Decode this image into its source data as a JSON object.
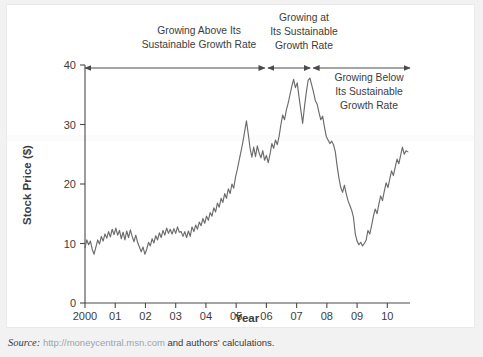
{
  "figure": {
    "background_color": "#f2f2f2",
    "panel_color": "#ffffff",
    "line_color": "#6b6b6b",
    "axis_color": "#4a4a4a"
  },
  "source": {
    "label": "Source:",
    "url": "http://moneycentral.msn.com",
    "tail": "and authors' calculations."
  },
  "chart_data": {
    "type": "line",
    "title": "",
    "xlabel": "Year",
    "ylabel": "Stock Price ($)",
    "xlim": [
      2000.0,
      2010.75
    ],
    "ylim": [
      0,
      40
    ],
    "grid": false,
    "legend": "none",
    "xtick_labels": [
      "2000",
      "01",
      "02",
      "03",
      "04",
      "05",
      "06",
      "07",
      "08",
      "09",
      "10"
    ],
    "xtick_values": [
      2000,
      2001,
      2002,
      2003,
      2004,
      2005,
      2006,
      2007,
      2008,
      2009,
      2010
    ],
    "ytick_labels": [
      "0",
      "10",
      "20",
      "30",
      "40"
    ],
    "ytick_values": [
      0,
      10,
      20,
      30,
      40
    ],
    "series": [
      {
        "name": "Stock Price",
        "x": [
          2000.0,
          2000.06,
          2000.12,
          2000.18,
          2000.24,
          2000.3,
          2000.36,
          2000.42,
          2000.48,
          2000.54,
          2000.6,
          2000.66,
          2000.72,
          2000.78,
          2000.84,
          2000.9,
          2000.96,
          2001.02,
          2001.08,
          2001.14,
          2001.2,
          2001.26,
          2001.32,
          2001.38,
          2001.44,
          2001.5,
          2001.56,
          2001.62,
          2001.68,
          2001.74,
          2001.8,
          2001.86,
          2001.92,
          2001.98,
          2002.04,
          2002.1,
          2002.16,
          2002.22,
          2002.28,
          2002.34,
          2002.4,
          2002.46,
          2002.52,
          2002.58,
          2002.64,
          2002.7,
          2002.76,
          2002.82,
          2002.88,
          2002.94,
          2003.0,
          2003.06,
          2003.12,
          2003.18,
          2003.24,
          2003.3,
          2003.36,
          2003.42,
          2003.48,
          2003.54,
          2003.6,
          2003.66,
          2003.72,
          2003.78,
          2003.84,
          2003.9,
          2003.96,
          2004.02,
          2004.08,
          2004.14,
          2004.2,
          2004.26,
          2004.32,
          2004.38,
          2004.44,
          2004.5,
          2004.56,
          2004.62,
          2004.68,
          2004.74,
          2004.8,
          2004.86,
          2004.92,
          2004.98,
          2005.04,
          2005.1,
          2005.16,
          2005.22,
          2005.28,
          2005.34,
          2005.4,
          2005.46,
          2005.52,
          2005.58,
          2005.64,
          2005.7,
          2005.76,
          2005.82,
          2005.88,
          2005.94,
          2006.0,
          2006.06,
          2006.12,
          2006.18,
          2006.24,
          2006.3,
          2006.36,
          2006.42,
          2006.48,
          2006.54,
          2006.6,
          2006.66,
          2006.72,
          2006.78,
          2006.84,
          2006.9,
          2006.96,
          2007.02,
          2007.08,
          2007.14,
          2007.2,
          2007.26,
          2007.32,
          2007.38,
          2007.44,
          2007.5,
          2007.56,
          2007.62,
          2007.68,
          2007.74,
          2007.8,
          2007.86,
          2007.92,
          2007.98,
          2008.04,
          2008.1,
          2008.16,
          2008.22,
          2008.28,
          2008.34,
          2008.4,
          2008.46,
          2008.52,
          2008.58,
          2008.64,
          2008.7,
          2008.76,
          2008.82,
          2008.88,
          2008.94,
          2009.0,
          2009.06,
          2009.12,
          2009.18,
          2009.24,
          2009.3,
          2009.36,
          2009.42,
          2009.48,
          2009.54,
          2009.6,
          2009.66,
          2009.72,
          2009.78,
          2009.84,
          2009.9,
          2009.96,
          2010.02,
          2010.08,
          2010.14,
          2010.2,
          2010.26,
          2010.32,
          2010.38,
          2010.44,
          2010.5,
          2010.56,
          2010.62,
          2010.68
        ],
        "values": [
          9.3,
          10.6,
          9.8,
          10.4,
          9.0,
          8.2,
          9.4,
          10.6,
          9.9,
          11.2,
          10.4,
          11.6,
          10.9,
          12.0,
          11.1,
          12.4,
          11.5,
          12.6,
          11.4,
          12.2,
          10.8,
          11.9,
          10.6,
          12.1,
          11.0,
          12.3,
          11.2,
          10.3,
          11.4,
          10.2,
          9.4,
          8.6,
          9.4,
          8.2,
          9.0,
          10.2,
          9.6,
          10.8,
          10.1,
          11.3,
          10.6,
          11.8,
          11.0,
          12.2,
          11.4,
          12.6,
          11.7,
          12.4,
          11.6,
          12.5,
          11.7,
          12.8,
          11.9,
          12.0,
          11.2,
          12.0,
          11.0,
          12.1,
          11.2,
          12.8,
          12.0,
          13.1,
          12.4,
          13.6,
          13.0,
          14.2,
          13.4,
          14.6,
          13.9,
          15.2,
          14.6,
          16.0,
          15.3,
          16.8,
          16.1,
          17.6,
          16.9,
          18.4,
          17.6,
          19.2,
          18.4,
          20.0,
          19.3,
          21.2,
          22.5,
          24.0,
          25.5,
          27.0,
          28.8,
          30.6,
          28.4,
          26.0,
          24.5,
          26.2,
          24.6,
          26.4,
          25.2,
          24.4,
          25.6,
          24.0,
          24.8,
          23.6,
          25.0,
          26.8,
          26.0,
          27.4,
          26.6,
          28.0,
          30.0,
          31.6,
          30.8,
          32.4,
          33.6,
          35.0,
          36.4,
          37.6,
          36.2,
          37.0,
          34.6,
          32.4,
          30.2,
          33.0,
          35.4,
          37.4,
          37.8,
          36.6,
          35.4,
          34.0,
          33.4,
          32.0,
          30.8,
          31.4,
          29.6,
          28.0,
          27.4,
          26.8,
          27.2,
          26.6,
          25.4,
          23.0,
          21.0,
          19.4,
          18.6,
          19.8,
          18.4,
          17.2,
          16.4,
          15.6,
          14.4,
          11.6,
          10.4,
          9.8,
          10.2,
          9.6,
          10.0,
          10.6,
          12.2,
          11.6,
          13.0,
          14.6,
          15.8,
          15.0,
          16.6,
          18.0,
          17.2,
          18.8,
          20.2,
          19.4,
          20.8,
          22.2,
          21.4,
          22.8,
          24.2,
          23.4,
          24.8,
          26.2,
          25.0,
          25.6,
          25.4
        ]
      }
    ],
    "annotations": [
      {
        "id": "above-rate",
        "lines": [
          "Growing Above Its",
          "Sustainable Growth Rate"
        ],
        "span_start": 2000.0,
        "span_end": 2005.95
      },
      {
        "id": "at-rate",
        "lines": [
          "Growing at",
          "Its Sustainable",
          "Growth Rate"
        ],
        "span_start": 2006.05,
        "span_end": 2007.45
      },
      {
        "id": "below-rate",
        "lines": [
          "Growing Below",
          "Its Sustainable",
          "Growth Rate"
        ],
        "span_start": 2007.55,
        "span_end": 2010.75
      }
    ]
  }
}
